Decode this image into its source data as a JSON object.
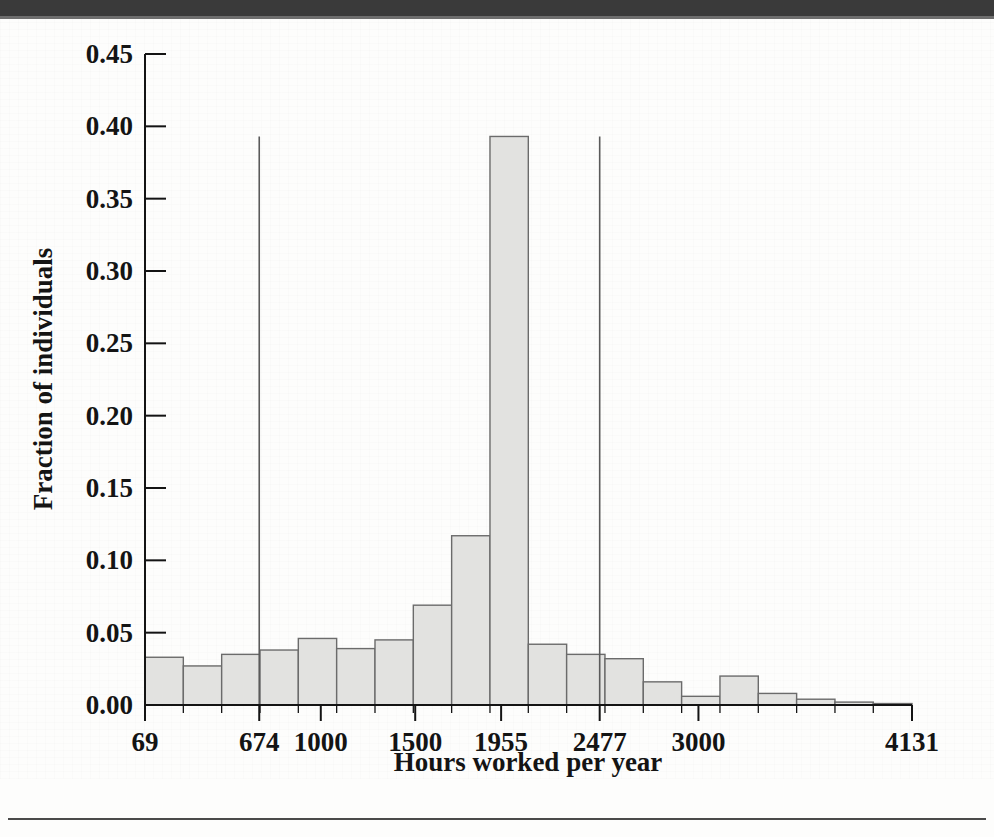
{
  "figure": {
    "background_color": "#fdfdfc",
    "ink_color": "#141414"
  },
  "chart_data": {
    "type": "bar",
    "title": "",
    "subtitle": "",
    "xlabel": "Hours worked per year",
    "ylabel": "Fraction of individuals",
    "grid": false,
    "legend": null,
    "bar_fill_color": "#e2e2e0",
    "bar_edge_color": "#6b6b6b",
    "xlim": [
      69,
      4131
    ],
    "ylim": [
      0.0,
      0.45
    ],
    "ytick_labels": [
      "0.00",
      "0.05",
      "0.10",
      "0.15",
      "0.20",
      "0.25",
      "0.30",
      "0.35",
      "0.40",
      "0.45"
    ],
    "ytick_values": [
      0.0,
      0.05,
      0.1,
      0.15,
      0.2,
      0.25,
      0.3,
      0.35,
      0.4,
      0.45
    ],
    "xtick_labels": [
      "69",
      "674",
      "1000",
      "1500",
      "1955",
      "2477",
      "3000",
      "4131"
    ],
    "xtick_values": [
      69,
      674,
      1000,
      1500,
      1955,
      2477,
      3000,
      4131
    ],
    "annotation_lines": [
      {
        "x": 674,
        "label": "674",
        "y_top": 0.393
      },
      {
        "x": 2477,
        "label": "2477",
        "y_top": 0.393
      }
    ],
    "bin_edges": [
      69,
      272,
      475,
      678,
      881,
      1084,
      1287,
      1490,
      1693,
      1896,
      2099,
      2302,
      2505,
      2708,
      2911,
      3114,
      3317,
      3520,
      3723,
      3926,
      4131
    ],
    "categories": [
      "69-272",
      "272-475",
      "475-678",
      "678-881",
      "881-1084",
      "1084-1287",
      "1287-1490",
      "1490-1693",
      "1693-1896",
      "1896-2099",
      "2099-2302",
      "2302-2505",
      "2505-2708",
      "2708-2911",
      "2911-3114",
      "3114-3317",
      "3317-3520",
      "3520-3723",
      "3723-3926",
      "3926-4131"
    ],
    "values": [
      0.033,
      0.027,
      0.035,
      0.038,
      0.046,
      0.039,
      0.045,
      0.069,
      0.117,
      0.393,
      0.042,
      0.035,
      0.032,
      0.016,
      0.006,
      0.02,
      0.008,
      0.004,
      0.002,
      0.001
    ]
  }
}
